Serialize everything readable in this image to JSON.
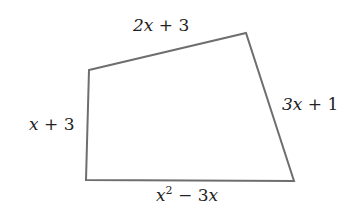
{
  "diagram": {
    "type": "quadrilateral",
    "stroke_color": "#6e6e6e",
    "vertices": [
      [
        89,
        70
      ],
      [
        246,
        33
      ],
      [
        294,
        181
      ],
      [
        86,
        180
      ]
    ],
    "sides": {
      "top": {
        "var": "2x",
        "rest": " + 3"
      },
      "right": {
        "var": "3x",
        "rest": " + 1"
      },
      "left": {
        "var": "x",
        "rest": " + 3"
      },
      "bottom": {
        "base": "x",
        "exp": "2",
        "rest": " − 3",
        "var2": "x"
      }
    }
  }
}
